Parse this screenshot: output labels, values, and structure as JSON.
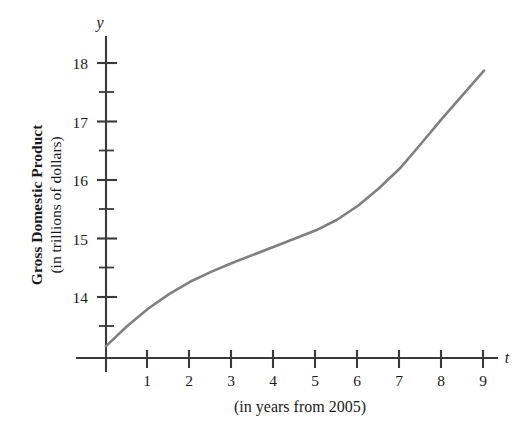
{
  "chart_data": {
    "type": "line",
    "title": "",
    "subtitle": "",
    "xlabel": "(in years from 2005)",
    "ylabel": "Gross Domestic Product (in trillions of dollars)",
    "ylabel_line1": "Gross Domestic Product",
    "ylabel_line2": "(in trillions of dollars)",
    "x_axis_variable": "t",
    "y_axis_variable": "y",
    "grid": false,
    "legend": false,
    "xlim": [
      0,
      9.6
    ],
    "ylim": [
      13.0,
      18.35
    ],
    "x_ticks": [
      1,
      2,
      3,
      4,
      5,
      6,
      7,
      8,
      9
    ],
    "x_tick_labels": [
      "1",
      "2",
      "3",
      "4",
      "5",
      "6",
      "7",
      "8",
      "9"
    ],
    "y_ticks": [
      14,
      15,
      16,
      17,
      18
    ],
    "y_tick_labels": [
      "14",
      "15",
      "16",
      "17",
      "18"
    ],
    "y_minor_ticks": [
      13.5,
      14.5,
      15.5,
      16.5,
      17.5
    ],
    "series": [
      {
        "name": "Gross Domestic Product",
        "color": "#808080",
        "x": [
          0,
          0.5,
          1,
          1.5,
          2,
          2.5,
          3,
          3.5,
          4,
          4.5,
          5,
          5.5,
          6,
          6.5,
          7,
          7.5,
          8,
          8.5,
          9
        ],
        "y": [
          13.16,
          13.5,
          13.8,
          14.05,
          14.26,
          14.43,
          14.58,
          14.72,
          14.86,
          15.0,
          15.14,
          15.32,
          15.56,
          15.86,
          16.2,
          16.62,
          17.05,
          17.46,
          17.87
        ]
      }
    ]
  },
  "axis": {
    "y_variable": "y",
    "x_variable": "t"
  },
  "caption": {
    "x_axis": "(in years from 2005)"
  },
  "y_axis_title": {
    "line1": "Gross Domestic Product",
    "line2": "(in trillions of dollars)"
  },
  "colors": {
    "curve": "#808080",
    "axis": "#3a3a3a",
    "text": "#1a1a1a",
    "background": "#ffffff"
  }
}
